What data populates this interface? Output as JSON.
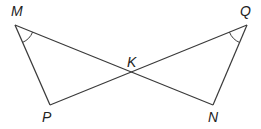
{
  "diagram": {
    "type": "geometry",
    "points": [
      {
        "name": "M",
        "label": "M",
        "x": 15,
        "y": 25,
        "lx": 11,
        "ly": 16
      },
      {
        "name": "Q",
        "label": "Q",
        "x": 247,
        "y": 25,
        "lx": 240,
        "ly": 16
      },
      {
        "name": "P",
        "label": "P",
        "x": 50,
        "y": 105,
        "lx": 42,
        "ly": 122
      },
      {
        "name": "N",
        "label": "N",
        "x": 213,
        "y": 105,
        "lx": 208,
        "ly": 122
      },
      {
        "name": "K",
        "label": "K",
        "x": 131,
        "y": 76,
        "lx": 127,
        "ly": 67
      }
    ],
    "segments": [
      [
        "M",
        "P"
      ],
      [
        "M",
        "N"
      ],
      [
        "Q",
        "P"
      ],
      [
        "Q",
        "N"
      ]
    ],
    "angle_marks": [
      "M",
      "Q"
    ],
    "stroke_color": "#3a3a3a"
  }
}
